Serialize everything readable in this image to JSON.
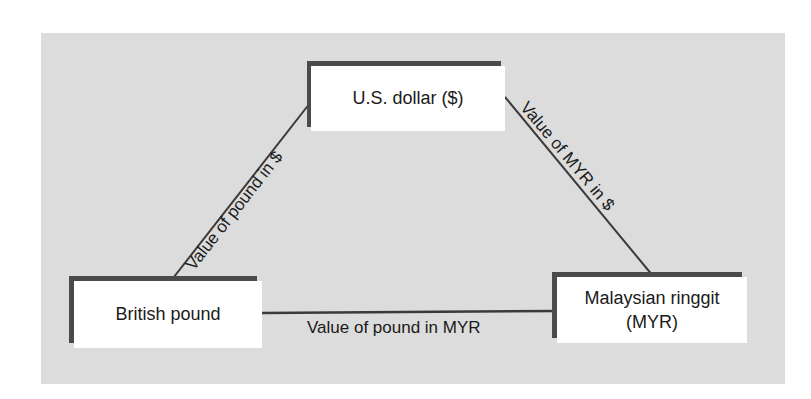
{
  "diagram": {
    "type": "triangular-exchange-rate-diagram",
    "nodes": {
      "usd": {
        "label": "U.S. dollar ($)"
      },
      "gbp": {
        "label": "British pound"
      },
      "myr": {
        "label_line1": "Malaysian ringgit",
        "label_line2": "(MYR)"
      }
    },
    "edges": {
      "gbp_usd": {
        "label": "Value of pound in $"
      },
      "myr_usd": {
        "label": "Value of MYR in $"
      },
      "gbp_myr": {
        "label": "Value of pound in MYR"
      }
    },
    "colors": {
      "background": "#dcdcdc",
      "box": "#ffffff",
      "box_shadow": "#4a4a4a",
      "line": "#3a3a3a",
      "text": "#1a1a1a"
    }
  }
}
